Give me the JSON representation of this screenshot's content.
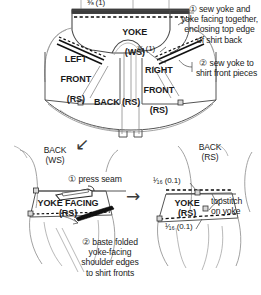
{
  "diagram": {
    "ink_color": "#222222",
    "line_color": "#6e6e6e",
    "dash_color": "#111111"
  },
  "top_panel": {
    "measurement_top": "⅜ (1)",
    "measurement_right": "⅜ (1)",
    "pieces": [
      {
        "name": "yoke",
        "line1": "YOKE",
        "line2": "(WS)"
      },
      {
        "name": "left-front",
        "line1": "LEFT",
        "line2": "FRONT",
        "line3": "(RS)"
      },
      {
        "name": "right-front",
        "line1": "RIGHT",
        "line2": "FRONT",
        "line3": "(RS)"
      },
      {
        "name": "back",
        "line1": "BACK (RS)"
      }
    ],
    "steps": [
      {
        "number": "①",
        "text": "① sew yoke and\nyoke facing together,\nenclosing top edge\nof shirt back"
      },
      {
        "number": "②",
        "text": "② sew yoke to\nshirt front pieces"
      }
    ]
  },
  "transition": {
    "arrow_down": "↙",
    "arrow_right": "→"
  },
  "bottom_left_panel": {
    "back_label": "BACK\n(WS)",
    "piece_label": "YOKE FACING\n(RS)",
    "press_step": "① press seam",
    "iron_icon": "iron-icon",
    "baste_step": "② baste folded\nyoke-facing\nshoulder edges\nto shirt fronts"
  },
  "bottom_right_panel": {
    "back_label": "BACK\n(RS)",
    "piece_label": "YOKE\n(RS)",
    "measurement_top": "¹⁄₁₆ (0.1)",
    "measurement_bottom": "¹⁄₁₆ (0.1)",
    "topstitch_note": "topstitch\non yoke"
  }
}
